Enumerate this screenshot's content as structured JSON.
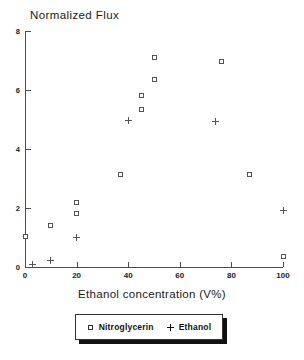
{
  "chart_data": {
    "type": "scatter",
    "title": "Normalized Flux",
    "xlabel": "Ethanol concentration (V%)",
    "ylabel": "Normalized Flux",
    "xlim": [
      0,
      100
    ],
    "ylim": [
      0,
      8
    ],
    "xticks": [
      0,
      20,
      40,
      60,
      80,
      100
    ],
    "yticks": [
      0,
      2,
      4,
      6,
      8
    ],
    "xtick_labels": [
      "0",
      "20",
      "40",
      "60",
      "80",
      "100"
    ],
    "ytick_labels": [
      "0",
      "2",
      "4",
      "6",
      "8"
    ],
    "grid": false,
    "legend_position": "below-axes",
    "series": [
      {
        "name": "Nitroglycerin",
        "marker": "open-square",
        "color": "#555555",
        "points": [
          {
            "x": 0,
            "y": 1.05
          },
          {
            "x": 10,
            "y": 1.4
          },
          {
            "x": 20,
            "y": 2.2
          },
          {
            "x": 20,
            "y": 1.8
          },
          {
            "x": 37,
            "y": 3.15
          },
          {
            "x": 45,
            "y": 5.8
          },
          {
            "x": 45,
            "y": 5.35
          },
          {
            "x": 50,
            "y": 6.35
          },
          {
            "x": 50,
            "y": 7.1
          },
          {
            "x": 76,
            "y": 6.95
          },
          {
            "x": 87,
            "y": 3.15
          },
          {
            "x": 100,
            "y": 0.35
          }
        ]
      },
      {
        "name": "Ethanol",
        "marker": "plus",
        "color": "#555555",
        "points": [
          {
            "x": 3,
            "y": 0.08
          },
          {
            "x": 10,
            "y": 0.22
          },
          {
            "x": 20,
            "y": 1.0
          },
          {
            "x": 40,
            "y": 4.95
          },
          {
            "x": 74,
            "y": 4.92
          },
          {
            "x": 100,
            "y": 1.92
          }
        ]
      }
    ]
  },
  "legend": {
    "entries": [
      {
        "label": "Nitroglycerin",
        "key": "open-square"
      },
      {
        "label": "Ethanol",
        "key": "plus"
      }
    ]
  }
}
